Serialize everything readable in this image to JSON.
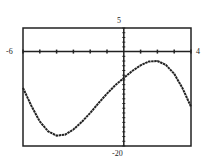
{
  "chart_data": {
    "type": "line",
    "title": "",
    "xlabel": "",
    "ylabel": "",
    "xlim": [
      -6,
      4
    ],
    "ylim": [
      -20,
      5
    ],
    "x_tick_step": 1,
    "y_tick_step": 1,
    "grid": false,
    "legend": null,
    "window_labels": {
      "xmin": "-6",
      "xmax": "4",
      "ymin": "-20",
      "ymax": "5"
    },
    "series": [
      {
        "name": "f(x)",
        "x": [
          -6,
          -5.5,
          -5,
          -4.5,
          -4,
          -3.5,
          -3,
          -2.5,
          -2,
          -1.5,
          -1,
          -0.5,
          0,
          0.5,
          1,
          1.5,
          2,
          2.5,
          3,
          3.5,
          4
        ],
        "y": [
          -7.7,
          -11.5,
          -14.8,
          -16.9,
          -17.8,
          -17.6,
          -16.5,
          -14.9,
          -13.0,
          -10.9,
          -8.9,
          -7.1,
          -5.6,
          -4.1,
          -2.9,
          -2.1,
          -2.0,
          -2.8,
          -4.7,
          -7.8,
          -11.7
        ]
      }
    ]
  }
}
